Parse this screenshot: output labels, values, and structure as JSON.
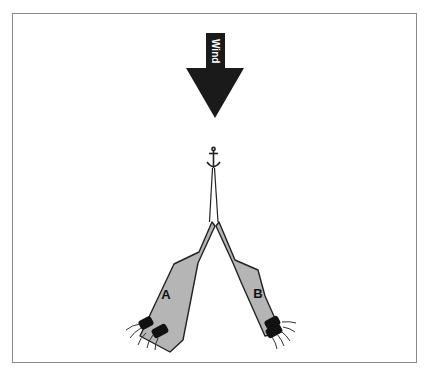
{
  "diagram": {
    "wind_label": "Wind",
    "boats": [
      {
        "id": "A",
        "label": "A",
        "position": "left"
      },
      {
        "id": "B",
        "label": "B",
        "position": "right"
      }
    ],
    "anchor": "anchor-icon",
    "colors": {
      "arrow": "#1a1a1a",
      "hull": "#b5b5b5",
      "outline": "#222222",
      "frame": "#8a8a8a",
      "motor": "#111111"
    }
  }
}
